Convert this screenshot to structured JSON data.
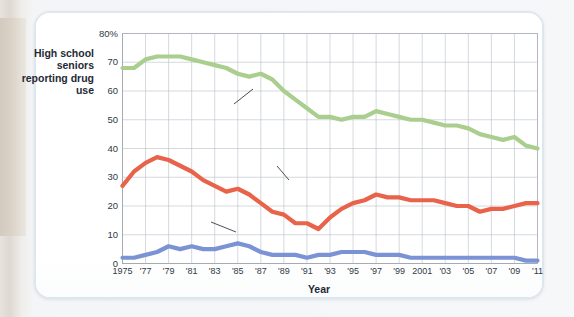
{
  "figure": {
    "y_axis_title": "High school seniors reporting drug use",
    "x_axis_title": "Year"
  },
  "chart_data": {
    "type": "line",
    "title": "",
    "xlabel": "Year",
    "ylabel": "High school seniors reporting drug use",
    "xlim": [
      1975,
      2011
    ],
    "ylim": [
      0,
      80
    ],
    "yticks": [
      0,
      10,
      20,
      30,
      40,
      50,
      60,
      70,
      80
    ],
    "ytick_labels": [
      "0",
      "10",
      "20",
      "30",
      "40",
      "50",
      "60",
      "70",
      "80%"
    ],
    "grid": true,
    "legend": "inline-annotations",
    "x": [
      1975,
      1976,
      1977,
      1978,
      1979,
      1980,
      1981,
      1982,
      1983,
      1984,
      1985,
      1986,
      1987,
      1988,
      1989,
      1990,
      1991,
      1992,
      1993,
      1994,
      1995,
      1996,
      1997,
      1998,
      1999,
      2000,
      2001,
      2002,
      2003,
      2004,
      2005,
      2006,
      2007,
      2008,
      2009,
      2010,
      2011
    ],
    "xticks": [
      1975,
      1977,
      1979,
      1981,
      1983,
      1985,
      1987,
      1989,
      1991,
      1993,
      1995,
      1997,
      1999,
      2001,
      2003,
      2005,
      2007,
      2009,
      2011
    ],
    "xtick_labels": [
      "1975",
      "'77",
      "'79",
      "'81",
      "'83",
      "'85",
      "'87",
      "'89",
      "'91",
      "'93",
      "'95",
      "'97",
      "'99",
      "2001",
      "'03",
      "'05",
      "'07",
      "'09",
      "'11"
    ],
    "series": [
      {
        "name": "Alcohol",
        "color": "#a9ce8e",
        "label_text": "Alcohol",
        "values": [
          68,
          68,
          71,
          72,
          72,
          72,
          71,
          70,
          69,
          68,
          66,
          65,
          66,
          64,
          60,
          57,
          54,
          51,
          51,
          50,
          51,
          51,
          53,
          52,
          51,
          50,
          50,
          49,
          48,
          48,
          47,
          45,
          44,
          43,
          44,
          41,
          40
        ]
      },
      {
        "name": "Marijuana/hashish",
        "color": "#e8634a",
        "label_text": "Marijuana/ hashish",
        "label_line1": "Marijuana/",
        "label_line2": "hashish",
        "values": [
          27,
          32,
          35,
          37,
          36,
          34,
          32,
          29,
          27,
          25,
          26,
          24,
          21,
          18,
          17,
          14,
          14,
          12,
          16,
          19,
          21,
          22,
          24,
          23,
          23,
          22,
          22,
          22,
          21,
          20,
          20,
          18,
          19,
          19,
          20,
          21,
          21
        ]
      },
      {
        "name": "Cocaine",
        "color": "#7b93d4",
        "label_text": "Cocaine",
        "values": [
          2,
          2,
          3,
          4,
          6,
          5,
          6,
          5,
          5,
          6,
          7,
          6,
          4,
          3,
          3,
          3,
          2,
          3,
          3,
          4,
          4,
          4,
          3,
          3,
          3,
          2,
          2,
          2,
          2,
          2,
          2,
          2,
          2,
          2,
          2,
          1,
          1
        ]
      }
    ]
  }
}
